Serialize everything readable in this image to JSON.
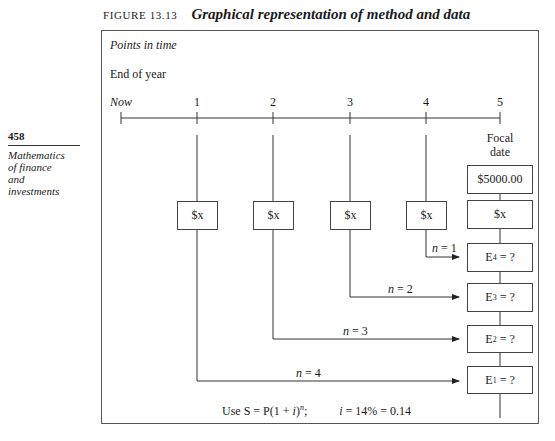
{
  "caption": {
    "number": "FIGURE 13.13",
    "title": "Graphical representation of method and data"
  },
  "sidebar": {
    "page_number": "458",
    "book_title_lines": [
      "Mathematics",
      "of finance",
      "and",
      "investments"
    ]
  },
  "diagram": {
    "points_in_time_label": "Points in time",
    "end_of_year_label": "End of year",
    "timeline": {
      "now_label": "Now",
      "ticks": [
        "1",
        "2",
        "3",
        "4",
        "5"
      ]
    },
    "focal_date_label": [
      "Focal",
      "date"
    ],
    "focal_value": "$5000.00",
    "payment_label": "$x",
    "payments": [
      {
        "year": "1",
        "label": "$x"
      },
      {
        "year": "2",
        "label": "$x"
      },
      {
        "year": "3",
        "label": "$x"
      },
      {
        "year": "4",
        "label": "$x"
      },
      {
        "year": "5",
        "label": "$x"
      }
    ],
    "equivalents": [
      {
        "name": "E",
        "sub": "4",
        "text": " = ?",
        "n_label": "n",
        "n_value": "= 1"
      },
      {
        "name": "E",
        "sub": "3",
        "text": " = ?",
        "n_label": "n",
        "n_value": "= 2"
      },
      {
        "name": "E",
        "sub": "2",
        "text": " = ?",
        "n_label": "n",
        "n_value": "= 3"
      },
      {
        "name": "E",
        "sub": "1",
        "text": " = ?",
        "n_label": "n",
        "n_value": "= 4"
      }
    ],
    "formula": {
      "prefix": "Use S = P(1 + ",
      "i": "i",
      "close": ")",
      "exp": "n",
      "sep": ";",
      "rate_i": "i",
      "rate": " = 14% = 0.14"
    }
  }
}
